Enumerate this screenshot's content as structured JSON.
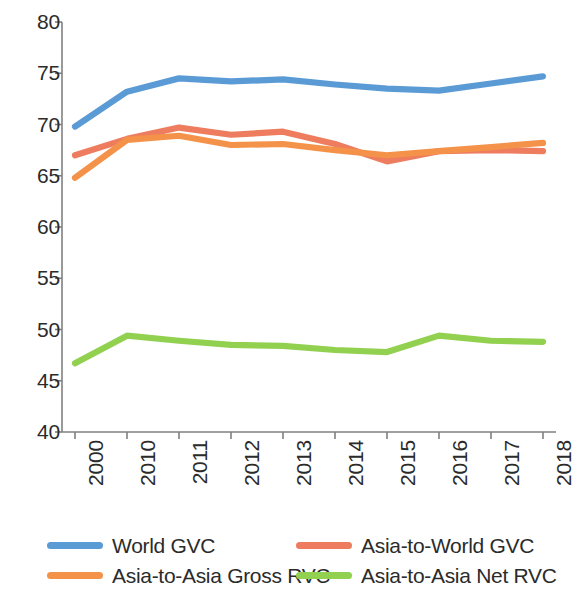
{
  "chart_data": {
    "type": "line",
    "title": "",
    "subtitle": "",
    "xlabel": "",
    "ylabel": "",
    "categories": [
      "2000",
      "2010",
      "2011",
      "2012",
      "2013",
      "2014",
      "2015",
      "2016",
      "2017",
      "2018"
    ],
    "ylim": [
      40,
      80
    ],
    "yticks": [
      40,
      45,
      50,
      55,
      60,
      65,
      70,
      75,
      80
    ],
    "ytick_labels": [
      "40",
      "45",
      "50",
      "55",
      "60",
      "65",
      "70",
      "75",
      "80"
    ],
    "grid": false,
    "legend_position": "bottom",
    "series": [
      {
        "name": "World GVC",
        "color": "#5B9BD5",
        "values": [
          69.8,
          73.2,
          74.5,
          74.2,
          74.4,
          73.9,
          73.5,
          73.3,
          74.0,
          74.7
        ]
      },
      {
        "name": "Asia-to-World GVC",
        "color": "#ED7D5E",
        "values": [
          67.0,
          68.6,
          69.7,
          69.0,
          69.3,
          68.1,
          66.4,
          67.4,
          67.5,
          67.4
        ]
      },
      {
        "name": "Asia-to-Asia Gross RVC",
        "color": "#F4924A",
        "values": [
          64.8,
          68.5,
          68.9,
          68.0,
          68.1,
          67.5,
          67.0,
          67.4,
          67.8,
          68.2
        ]
      },
      {
        "name": "Asia-to-Asia Net RVC",
        "color": "#92D050",
        "values": [
          46.7,
          49.4,
          48.9,
          48.5,
          48.4,
          48.0,
          47.8,
          49.4,
          48.9,
          48.8
        ]
      }
    ]
  },
  "axis": {
    "line_color": "#808080",
    "tick_color": "#808080"
  },
  "legend": {
    "items": [
      {
        "label": "World GVC",
        "color": "#5B9BD5",
        "swatch_name": "legend-swatch-world-gvc"
      },
      {
        "label": "Asia-to-World GVC",
        "color": "#ED7D5E",
        "swatch_name": "legend-swatch-asia-to-world-gvc"
      },
      {
        "label": "Asia-to-Asia Gross RVC",
        "color": "#F4924A",
        "swatch_name": "legend-swatch-asia-to-asia-gross-rvc"
      },
      {
        "label": "Asia-to-Asia Net RVC",
        "color": "#92D050",
        "swatch_name": "legend-swatch-asia-to-asia-net-rvc"
      }
    ]
  }
}
